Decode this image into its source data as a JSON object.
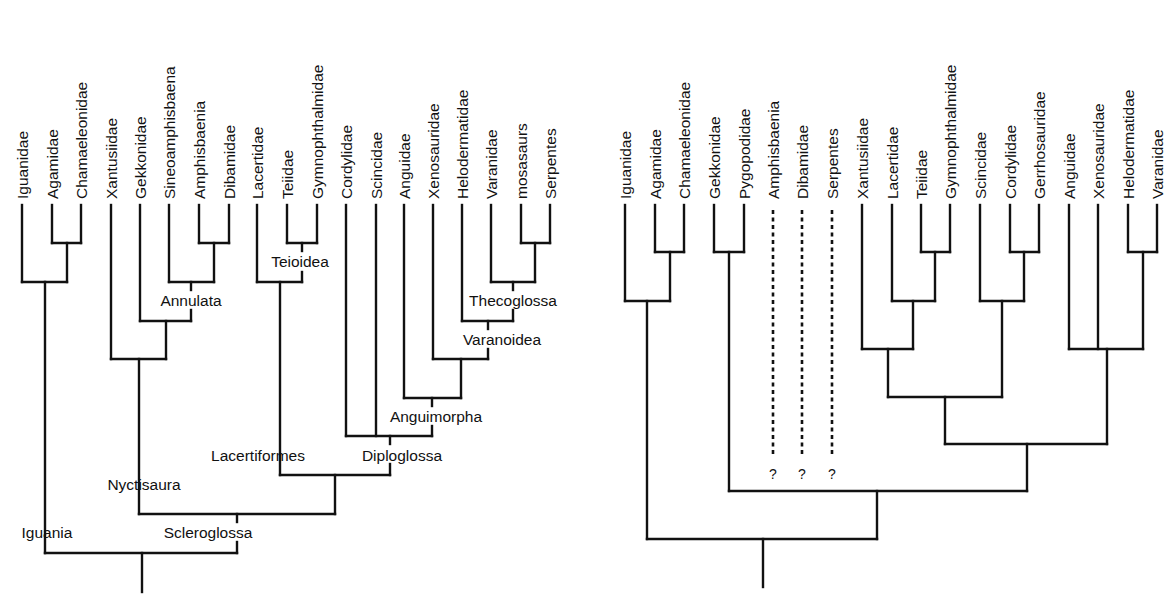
{
  "colors": {
    "line": "#111111",
    "background": "#ffffff",
    "text": "#111111"
  },
  "trees": [
    {
      "id": "left",
      "name": "morphology-tree",
      "tip_y": 205,
      "tips": [
        {
          "label": "Iguanidae",
          "x": 22
        },
        {
          "label": "Agamidae",
          "x": 52
        },
        {
          "label": "Chamaeleonidae",
          "x": 81
        },
        {
          "label": "Xantusiidae",
          "x": 111
        },
        {
          "label": "Gekkonidae",
          "x": 140
        },
        {
          "label": "Sineoamphisbaena",
          "x": 169
        },
        {
          "label": "Amphisbaenia",
          "x": 199
        },
        {
          "label": "Dibamidae",
          "x": 229
        },
        {
          "label": "Lacertidae",
          "x": 257
        },
        {
          "label": "Teiidae",
          "x": 287
        },
        {
          "label": "Gymnophthalmidae",
          "x": 317
        },
        {
          "label": "Cordylidae",
          "x": 346
        },
        {
          "label": "Scincidae",
          "x": 376
        },
        {
          "label": "Anguidae",
          "x": 404
        },
        {
          "label": "Xenosauridae",
          "x": 433
        },
        {
          "label": "Helodermatidae",
          "x": 462
        },
        {
          "label": "Varanidae",
          "x": 491
        },
        {
          "label": "mosasaurs",
          "x": 521
        },
        {
          "label": "Serpentes",
          "x": 550
        }
      ],
      "segments": [
        [
          22,
          205,
          22,
          282
        ],
        [
          52,
          205,
          52,
          243
        ],
        [
          81,
          205,
          81,
          243
        ],
        [
          52,
          243,
          81,
          243
        ],
        [
          67,
          243,
          67,
          282
        ],
        [
          22,
          282,
          67,
          282
        ],
        [
          45,
          282,
          45,
          553
        ],
        [
          199,
          205,
          199,
          243
        ],
        [
          229,
          205,
          229,
          243
        ],
        [
          199,
          243,
          229,
          243
        ],
        [
          214,
          243,
          214,
          282
        ],
        [
          169,
          205,
          169,
          282
        ],
        [
          169,
          282,
          214,
          282
        ],
        [
          191,
          282,
          191,
          290
        ],
        [
          191,
          310,
          191,
          321
        ],
        [
          140,
          205,
          140,
          321
        ],
        [
          140,
          321,
          191,
          321
        ],
        [
          166,
          321,
          166,
          359
        ],
        [
          111,
          205,
          111,
          359
        ],
        [
          111,
          359,
          166,
          359
        ],
        [
          139,
          359,
          139,
          514
        ],
        [
          287,
          205,
          287,
          243
        ],
        [
          317,
          205,
          317,
          243
        ],
        [
          287,
          243,
          317,
          243
        ],
        [
          302,
          243,
          302,
          251
        ],
        [
          302,
          272,
          302,
          282
        ],
        [
          257,
          205,
          257,
          282
        ],
        [
          257,
          282,
          302,
          282
        ],
        [
          280,
          282,
          280,
          475
        ],
        [
          521,
          205,
          521,
          243
        ],
        [
          550,
          205,
          550,
          243
        ],
        [
          521,
          243,
          550,
          243
        ],
        [
          535,
          243,
          535,
          282
        ],
        [
          491,
          205,
          491,
          282
        ],
        [
          491,
          282,
          535,
          282
        ],
        [
          513,
          282,
          513,
          290
        ],
        [
          513,
          310,
          513,
          321
        ],
        [
          462,
          205,
          462,
          321
        ],
        [
          462,
          321,
          513,
          321
        ],
        [
          488,
          321,
          488,
          329
        ],
        [
          488,
          349,
          488,
          359
        ],
        [
          433,
          205,
          433,
          359
        ],
        [
          433,
          359,
          488,
          359
        ],
        [
          461,
          359,
          461,
          398
        ],
        [
          404,
          205,
          404,
          398
        ],
        [
          404,
          398,
          461,
          398
        ],
        [
          432,
          398,
          432,
          406
        ],
        [
          432,
          426,
          432,
          436
        ],
        [
          346,
          205,
          346,
          436
        ],
        [
          376,
          205,
          376,
          436
        ],
        [
          346,
          436,
          432,
          436
        ],
        [
          390,
          436,
          390,
          444
        ],
        [
          390,
          464,
          390,
          475
        ],
        [
          280,
          475,
          390,
          475
        ],
        [
          335,
          475,
          335,
          514
        ],
        [
          139,
          514,
          335,
          514
        ],
        [
          237,
          514,
          237,
          522
        ],
        [
          237,
          542,
          237,
          553
        ],
        [
          45,
          553,
          237,
          553
        ],
        [
          142,
          553,
          142,
          592
        ]
      ],
      "dotted": [],
      "clade_labels": [
        {
          "text": "Annulata",
          "x": 191,
          "y": 306,
          "anchor": "middle"
        },
        {
          "text": "Teioidea",
          "x": 300,
          "y": 267,
          "anchor": "middle"
        },
        {
          "text": "Thecoglossa",
          "x": 513,
          "y": 306,
          "anchor": "middle"
        },
        {
          "text": "Varanoidea",
          "x": 502,
          "y": 345,
          "anchor": "middle"
        },
        {
          "text": "Anguimorpha",
          "x": 436,
          "y": 422,
          "anchor": "middle"
        },
        {
          "text": "Diploglossa",
          "x": 402,
          "y": 461,
          "anchor": "middle"
        },
        {
          "text": "Lacertiformes",
          "x": 258,
          "y": 461,
          "anchor": "middle"
        },
        {
          "text": "Nyctisaura",
          "x": 144,
          "y": 490,
          "anchor": "middle"
        },
        {
          "text": "Scleroglossa",
          "x": 208,
          "y": 538,
          "anchor": "middle"
        },
        {
          "text": "Iguania",
          "x": 47,
          "y": 538,
          "anchor": "middle"
        }
      ],
      "question_marks": []
    },
    {
      "id": "right",
      "name": "molecular-tree",
      "tip_y": 205,
      "tips": [
        {
          "label": "Iguanidae",
          "x": 625
        },
        {
          "label": "Agamidae",
          "x": 655
        },
        {
          "label": "Chamaeleonidae",
          "x": 684
        },
        {
          "label": "Gekkonidae",
          "x": 714
        },
        {
          "label": "Pygopodidae",
          "x": 744
        },
        {
          "label": "Amphisbaenia",
          "x": 773
        },
        {
          "label": "Dibamidae",
          "x": 802
        },
        {
          "label": "Serpentes",
          "x": 832
        },
        {
          "label": "Xantusiidae",
          "x": 862
        },
        {
          "label": "Lacertidae",
          "x": 892
        },
        {
          "label": "Teiidae",
          "x": 921
        },
        {
          "label": "Gymnophthalmidae",
          "x": 950
        },
        {
          "label": "Scincidae",
          "x": 980
        },
        {
          "label": "Cordylidae",
          "x": 1010
        },
        {
          "label": "Gerrhosauridae",
          "x": 1039
        },
        {
          "label": "Anguidae",
          "x": 1069
        },
        {
          "label": "Xenosauridae",
          "x": 1098
        },
        {
          "label": "Helodermatidae",
          "x": 1128
        },
        {
          "label": "Varanidae",
          "x": 1157
        }
      ],
      "segments": [
        [
          655,
          205,
          655,
          252
        ],
        [
          684,
          205,
          684,
          252
        ],
        [
          655,
          252,
          684,
          252
        ],
        [
          670,
          252,
          670,
          301
        ],
        [
          625,
          205,
          625,
          301
        ],
        [
          625,
          301,
          670,
          301
        ],
        [
          647,
          301,
          647,
          539
        ],
        [
          714,
          205,
          714,
          252
        ],
        [
          744,
          205,
          744,
          252
        ],
        [
          714,
          252,
          744,
          252
        ],
        [
          729,
          252,
          729,
          491
        ],
        [
          921,
          205,
          921,
          252
        ],
        [
          950,
          205,
          950,
          252
        ],
        [
          921,
          252,
          950,
          252
        ],
        [
          935,
          252,
          935,
          301
        ],
        [
          892,
          205,
          892,
          301
        ],
        [
          892,
          301,
          935,
          301
        ],
        [
          913,
          301,
          913,
          349
        ],
        [
          862,
          205,
          862,
          349
        ],
        [
          862,
          349,
          913,
          349
        ],
        [
          888,
          349,
          888,
          397
        ],
        [
          1010,
          205,
          1010,
          252
        ],
        [
          1039,
          205,
          1039,
          252
        ],
        [
          1010,
          252,
          1039,
          252
        ],
        [
          1024,
          252,
          1024,
          301
        ],
        [
          980,
          205,
          980,
          301
        ],
        [
          980,
          301,
          1024,
          301
        ],
        [
          1002,
          301,
          1002,
          397
        ],
        [
          888,
          397,
          1002,
          397
        ],
        [
          945,
          397,
          945,
          444
        ],
        [
          1128,
          205,
          1128,
          252
        ],
        [
          1157,
          205,
          1157,
          252
        ],
        [
          1128,
          252,
          1157,
          252
        ],
        [
          1143,
          252,
          1143,
          349
        ],
        [
          1069,
          205,
          1069,
          349
        ],
        [
          1098,
          205,
          1098,
          349
        ],
        [
          1069,
          349,
          1143,
          349
        ],
        [
          1107,
          349,
          1107,
          444
        ],
        [
          945,
          444,
          1107,
          444
        ],
        [
          1027,
          444,
          1027,
          491
        ],
        [
          729,
          491,
          1027,
          491
        ],
        [
          877,
          491,
          877,
          539
        ],
        [
          647,
          539,
          877,
          539
        ],
        [
          763,
          539,
          763,
          587
        ]
      ],
      "dotted": [
        [
          773,
          210,
          773,
          456
        ],
        [
          802,
          210,
          802,
          456
        ],
        [
          832,
          210,
          832,
          456
        ]
      ],
      "clade_labels": [],
      "question_marks": [
        {
          "text": "?",
          "x": 773,
          "y": 479
        },
        {
          "text": "?",
          "x": 802,
          "y": 479
        },
        {
          "text": "?",
          "x": 832,
          "y": 479
        }
      ]
    }
  ]
}
